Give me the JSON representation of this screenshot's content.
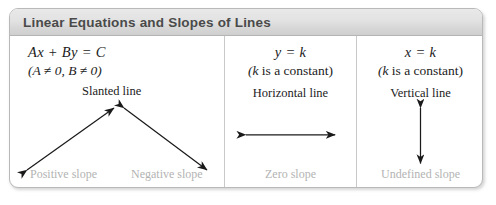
{
  "header": {
    "title": "Linear Equations and Slopes of Lines"
  },
  "panels": [
    {
      "id": "slanted",
      "equation": "Ax + By = C",
      "condition": "(A ≠ 0, B ≠ 0)",
      "line_type": "Slanted line",
      "arrow_icon": "double-headed-diagonal-arrows",
      "slope_labels": [
        "Positive slope",
        "Negative slope"
      ]
    },
    {
      "id": "horizontal",
      "equation": "y = k",
      "condition": "(k is a constant)",
      "line_type": "Horizontal line",
      "arrow_icon": "double-headed-horizontal-arrow",
      "slope_labels": [
        "Zero slope"
      ]
    },
    {
      "id": "vertical",
      "equation": "x = k",
      "condition": "(k is a constant)",
      "line_type": "Vertical line",
      "arrow_icon": "double-headed-vertical-arrow",
      "slope_labels": [
        "Undefined slope"
      ]
    }
  ],
  "colors": {
    "title_bar_top": "#e9e9e9",
    "title_bar_bottom": "#cfcfcf",
    "title_text": "#4a4a4a",
    "body_text": "#1b1b1b",
    "slope_label_text": "#b3b3b3",
    "border": "#b9b9b9",
    "divider": "#c9c9c9",
    "arrow": "#1a1a1a"
  }
}
